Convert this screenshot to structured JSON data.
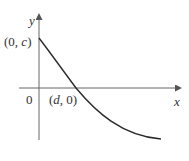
{
  "diagram": {
    "type": "function-graph",
    "axes": {
      "x_label": "x",
      "y_label": "y",
      "origin_label": "0"
    },
    "points": [
      {
        "name": "y-intercept",
        "label_open": "(0, ",
        "label_var": "c",
        "label_close": ")"
      },
      {
        "name": "x-intercept",
        "label_open": "(",
        "label_var": "d",
        "label_close": ", 0)"
      }
    ],
    "curve": {
      "description": "decreasing concave-up curve starting at (0, c), crossing the x-axis at (d, 0), flattening out below the x-axis",
      "color": "#2a2a2a"
    },
    "axis_color": "#555555"
  }
}
